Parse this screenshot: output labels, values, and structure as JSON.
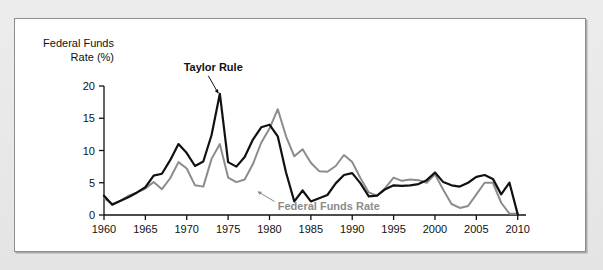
{
  "figure": {
    "panel_background": "#ffffff",
    "outer_background": "#e8e8e8",
    "border_color": "#8e8e8e"
  },
  "chart_data": {
    "type": "line",
    "title": "",
    "subtitle": "",
    "xlabel": "",
    "ylabel": "Federal Funds Rate (%)",
    "ylabel_line1": "Federal Funds",
    "ylabel_line2": "Rate (%)",
    "xlim": [
      1960,
      2011
    ],
    "ylim": [
      0,
      20
    ],
    "yticks": [
      0,
      5,
      10,
      15,
      20
    ],
    "ytick_labels": [
      "0",
      "5",
      "10",
      "15",
      "20"
    ],
    "xticks": [
      1960,
      1965,
      1970,
      1975,
      1980,
      1985,
      1990,
      1995,
      2000,
      2005,
      2010
    ],
    "xtick_labels": [
      "1960",
      "1965",
      "1970",
      "1975",
      "1980",
      "1985",
      "1990",
      "1995",
      "2000",
      "2005",
      "2010"
    ],
    "grid": false,
    "legend": "annotations",
    "annotations": [
      {
        "text": "Taylor Rule",
        "series": "Taylor Rule",
        "color": "#111111",
        "label_x": 1973.2,
        "label_y": 22.9,
        "arrow_from_x": 1972.6,
        "arrow_from_y": 21.6,
        "arrow_to_x": 1973.8,
        "arrow_to_y": 18.9
      },
      {
        "text": "Federal Funds Rate",
        "series": "Federal Funds Rate",
        "color": "#8c8c8c",
        "label_x": 1981.0,
        "label_y": 1.35,
        "arrow_from_x": 1980.6,
        "arrow_from_y": 2.1,
        "arrow_to_x": 1978.6,
        "arrow_to_y": 3.6
      }
    ],
    "x": [
      1960,
      1961,
      1962,
      1963,
      1964,
      1965,
      1966,
      1967,
      1968,
      1969,
      1970,
      1971,
      1972,
      1973,
      1974,
      1975,
      1976,
      1977,
      1978,
      1979,
      1980,
      1981,
      1982,
      1983,
      1984,
      1985,
      1986,
      1987,
      1988,
      1989,
      1990,
      1991,
      1992,
      1993,
      1994,
      1995,
      1996,
      1997,
      1998,
      1999,
      2000,
      2001,
      2002,
      2003,
      2004,
      2005,
      2006,
      2007,
      2008,
      2009,
      2010
    ],
    "series": [
      {
        "name": "Taylor Rule",
        "color": "#111111",
        "width": 2.2,
        "values": [
          3.0,
          1.6,
          2.2,
          2.8,
          3.5,
          4.3,
          6.1,
          6.4,
          8.5,
          11.0,
          9.6,
          7.6,
          8.3,
          12.4,
          18.8,
          8.2,
          7.5,
          9.0,
          11.7,
          13.6,
          14.0,
          12.2,
          6.6,
          2.1,
          3.8,
          2.1,
          2.6,
          3.1,
          4.9,
          6.2,
          6.5,
          4.9,
          2.9,
          3.0,
          4.0,
          4.6,
          4.5,
          4.6,
          4.8,
          5.4,
          6.6,
          5.1,
          4.6,
          4.4,
          5.0,
          5.9,
          6.2,
          5.6,
          3.2,
          5.0,
          0.1
        ]
      },
      {
        "name": "Federal Funds Rate",
        "color": "#8c8c8c",
        "width": 2.0,
        "values": [
          2.6,
          1.7,
          2.2,
          3.0,
          3.5,
          4.1,
          5.1,
          4.0,
          5.7,
          8.2,
          7.2,
          4.6,
          4.4,
          8.7,
          11.0,
          5.8,
          5.1,
          5.5,
          7.9,
          11.2,
          13.4,
          16.4,
          12.2,
          9.1,
          10.2,
          8.1,
          6.8,
          6.7,
          7.6,
          9.3,
          8.2,
          5.7,
          3.5,
          3.0,
          4.2,
          5.8,
          5.3,
          5.5,
          5.4,
          5.0,
          6.3,
          3.9,
          1.7,
          1.1,
          1.4,
          3.2,
          5.0,
          5.0,
          1.9,
          0.2,
          0.2
        ]
      }
    ]
  }
}
